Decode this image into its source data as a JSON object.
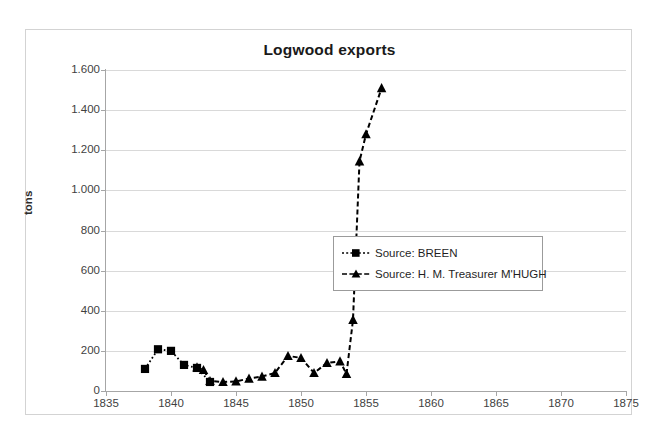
{
  "chart_data": {
    "type": "line",
    "title": "Logwood exports",
    "xlabel": "",
    "ylabel": "tons",
    "xlim": [
      1835,
      1875
    ],
    "ylim": [
      0,
      1600
    ],
    "xticks": [
      "1835",
      "1840",
      "1845",
      "1850",
      "1855",
      "1860",
      "1865",
      "1870",
      "1875"
    ],
    "yticks": [
      "0",
      "200",
      "400",
      "600",
      "800",
      "1.000",
      "1.200",
      "1.400",
      "1.600"
    ],
    "ytick_values": [
      0,
      200,
      400,
      600,
      800,
      1000,
      1200,
      1400,
      1600
    ],
    "xtick_values": [
      1835,
      1840,
      1845,
      1850,
      1855,
      1860,
      1865,
      1870,
      1875
    ],
    "grid": "horizontal",
    "legend_position": "center-right",
    "series": [
      {
        "name": "Source: BREEN",
        "marker": "square",
        "linestyle": "dotted",
        "color": "#000000",
        "x": [
          1838,
          1839,
          1840,
          1841,
          1842,
          1843
        ],
        "values": [
          110,
          208,
          200,
          130,
          115,
          45
        ]
      },
      {
        "name": "Source: H. M. Treasurer M'HUGH",
        "marker": "triangle",
        "linestyle": "dashed",
        "color": "#000000",
        "x": [
          1842,
          1842.5,
          1843,
          1844,
          1845,
          1846,
          1847,
          1848,
          1849,
          1850,
          1851,
          1852,
          1853,
          1853.5,
          1854,
          1854.5,
          1855,
          1856.2
        ],
        "values": [
          118,
          105,
          50,
          45,
          48,
          62,
          72,
          90,
          175,
          165,
          90,
          140,
          148,
          85,
          355,
          1145,
          1280,
          1510
        ]
      }
    ]
  },
  "legend": {
    "items": [
      {
        "label": "Source: BREEN",
        "marker": "square-dotted-key"
      },
      {
        "label": "Source: H. M. Treasurer M'HUGH",
        "marker": "triangle-dashed-key"
      }
    ]
  }
}
